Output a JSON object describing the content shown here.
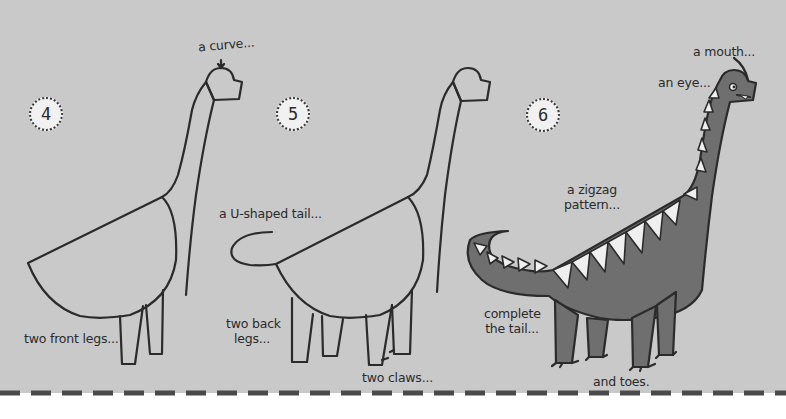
{
  "colors": {
    "background": "#c9c9c9",
    "ink": "#2b2b2b",
    "fill_dark": "#6f6f6f",
    "spike_fill": "#efefef",
    "page_bottom": "#ffffff"
  },
  "steps": [
    {
      "number": "4",
      "labels": {
        "curve": "a curve...",
        "front_legs": "two front legs..."
      }
    },
    {
      "number": "5",
      "labels": {
        "tail": "a U-shaped tail...",
        "back_legs_line1": "two back",
        "back_legs_line2": "legs...",
        "claws": "two claws..."
      }
    },
    {
      "number": "6",
      "labels": {
        "mouth": "a mouth...",
        "eye": "an eye...",
        "zigzag_line1": "a zigzag",
        "zigzag_line2": "pattern...",
        "tail_line1": "complete",
        "tail_line2": "the tail...",
        "toes": "and toes."
      }
    }
  ]
}
